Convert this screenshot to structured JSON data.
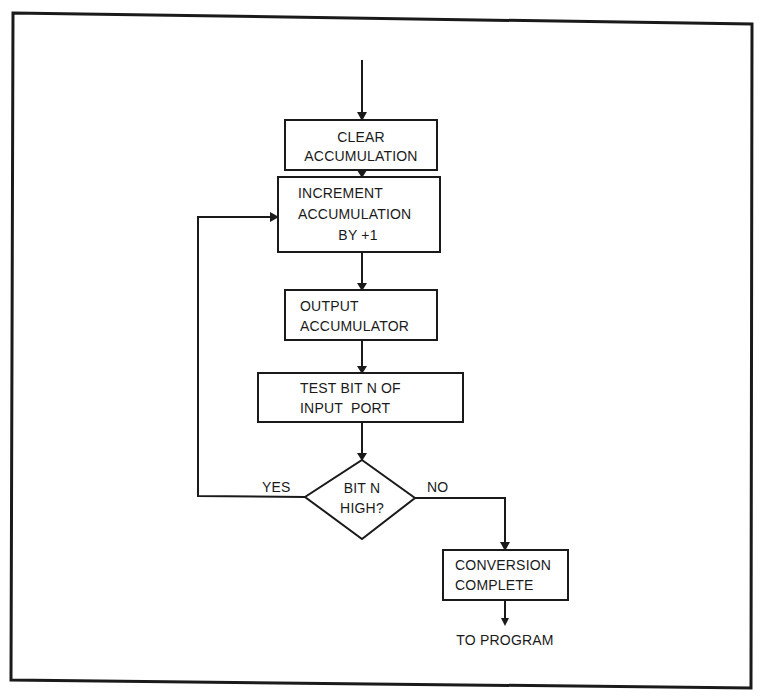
{
  "diagram": {
    "type": "flowchart",
    "nodes": [
      {
        "id": "clear",
        "shape": "process",
        "lines": [
          "CLEAR",
          "ACCUMULATION"
        ]
      },
      {
        "id": "increment",
        "shape": "process",
        "lines": [
          "INCREMENT",
          "ACCUMULATION",
          "BY +1"
        ]
      },
      {
        "id": "output",
        "shape": "process",
        "lines": [
          "OUTPUT",
          "ACCUMULATOR"
        ]
      },
      {
        "id": "test",
        "shape": "process",
        "lines": [
          "TEST BIT N OF",
          "INPUT  PORT"
        ]
      },
      {
        "id": "decision",
        "shape": "decision",
        "lines": [
          "BIT N",
          "HIGH?"
        ]
      },
      {
        "id": "complete",
        "shape": "process",
        "lines": [
          "CONVERSION",
          "COMPLETE"
        ]
      }
    ],
    "edges": [
      {
        "from": "entry",
        "to": "clear"
      },
      {
        "from": "clear",
        "to": "increment"
      },
      {
        "from": "increment",
        "to": "output"
      },
      {
        "from": "output",
        "to": "test"
      },
      {
        "from": "test",
        "to": "decision"
      },
      {
        "from": "decision",
        "to": "increment",
        "label": "YES"
      },
      {
        "from": "decision",
        "to": "complete",
        "label": "NO"
      },
      {
        "from": "complete",
        "to": "exit"
      }
    ],
    "labels": {
      "yes": "YES",
      "no": "NO",
      "exit": "TO PROGRAM"
    }
  }
}
